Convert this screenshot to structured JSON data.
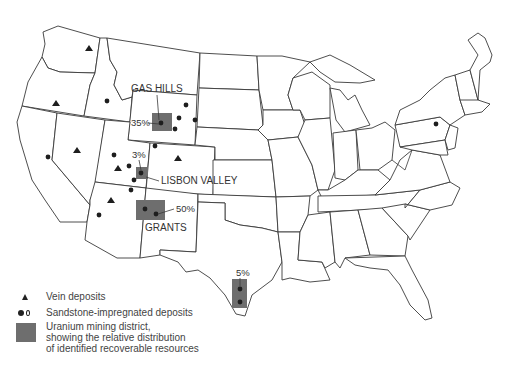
{
  "map": {
    "title": "Uranium deposits of the United States",
    "districts": [
      {
        "name": "GAS HILLS",
        "percent": "35%",
        "color": "#6e6e6e"
      },
      {
        "name": "LISBON VALLEY",
        "percent": "3%",
        "color": "#6e6e6e"
      },
      {
        "name": "GRANTS",
        "percent": "50%",
        "color": "#6e6e6e"
      },
      {
        "name": "",
        "percent": "5%",
        "color": "#6e6e6e"
      }
    ]
  },
  "legend": {
    "items": [
      {
        "symbol": "triangle-icon",
        "label": "Vein deposits"
      },
      {
        "symbol": "dot-icon",
        "label": "Sandstone-impregnated deposits"
      },
      {
        "symbol": "gray-box-icon",
        "label_lines": [
          "Uranium mining district,",
          "showing the relative distribution",
          "of identified recoverable resources"
        ]
      }
    ]
  }
}
